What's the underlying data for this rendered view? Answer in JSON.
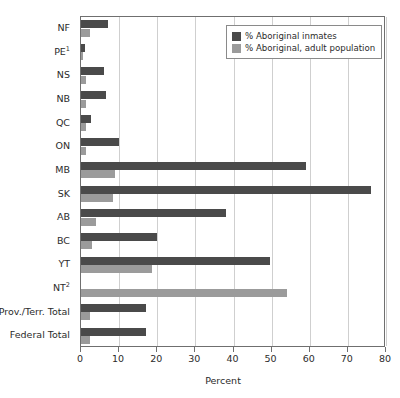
{
  "chart_data": {
    "type": "bar",
    "orientation": "horizontal",
    "title": "",
    "xlabel": "Percent",
    "ylabel": "",
    "xlim": [
      0,
      80
    ],
    "xticks": [
      0,
      10,
      20,
      30,
      40,
      50,
      60,
      70,
      80
    ],
    "grid": "vertical",
    "legend_position": "upper-right",
    "categories": [
      "NF",
      "PE¹",
      "NS",
      "NB",
      "QC",
      "ON",
      "MB",
      "SK",
      "AB",
      "BC",
      "YT",
      "NT²",
      "Prov./Terr. Total",
      "Federal Total"
    ],
    "series": [
      {
        "name": "% Aboriginal inmates",
        "color": "#4a4a4a",
        "values": [
          7.0,
          1.0,
          6.0,
          6.5,
          2.5,
          10.0,
          59.0,
          76.0,
          38.0,
          20.0,
          49.5,
          0.0,
          17.0,
          17.0
        ]
      },
      {
        "name": "% Aboriginal, adult population",
        "color": "#9b9b9b",
        "values": [
          2.4,
          0.4,
          1.2,
          1.2,
          1.3,
          1.4,
          9.0,
          8.5,
          4.0,
          3.0,
          18.5,
          54.0,
          2.4,
          2.4
        ]
      }
    ]
  },
  "legend": {
    "items": [
      {
        "label": "% Aboriginal inmates"
      },
      {
        "label": "% Aboriginal, adult population"
      }
    ]
  },
  "axis": {
    "x_title": "Percent",
    "tick_labels": [
      "0",
      "10",
      "20",
      "30",
      "40",
      "50",
      "60",
      "70",
      "80"
    ]
  },
  "colors": {
    "series_dark": "#4a4a4a",
    "series_light": "#9b9b9b",
    "gridline": "#cfcfcf",
    "frame": "#6f6f6f",
    "text": "#2b2b2b",
    "background": "#ffffff"
  }
}
